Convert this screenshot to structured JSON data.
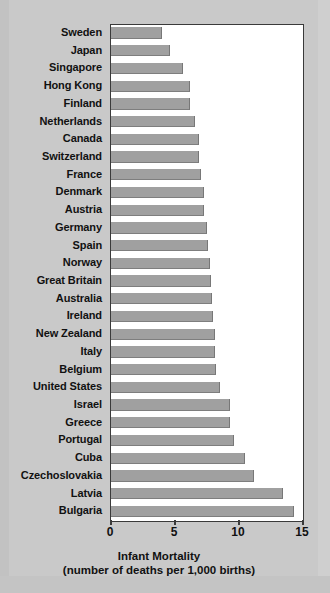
{
  "chart_data": {
    "type": "bar",
    "orientation": "horizontal",
    "title": "",
    "xlabel": "Infant Mortality",
    "xlabel_sub": "(number of deaths per 1,000 births)",
    "ylabel": "",
    "xlim": [
      0,
      15
    ],
    "xticks": [
      0,
      5,
      10,
      15
    ],
    "xtick_labels": [
      "0",
      "5",
      "10",
      "15"
    ],
    "grid": false,
    "legend": false,
    "bar_color": "#a0a0a0",
    "plot_background": "#ffffff",
    "page_background": "#c9c9c9",
    "categories": [
      "Sweden",
      "Japan",
      "Singapore",
      "Hong Kong",
      "Finland",
      "Netherlands",
      "Canada",
      "Switzerland",
      "France",
      "Denmark",
      "Austria",
      "Germany",
      "Spain",
      "Norway",
      "Great Britain",
      "Australia",
      "Ireland",
      "New Zealand",
      "Italy",
      "Belgium",
      "United States",
      "Israel",
      "Greece",
      "Portugal",
      "Cuba",
      "Czechoslovakia",
      "Latvia",
      "Bulgaria"
    ],
    "values": [
      4.0,
      4.6,
      5.6,
      6.2,
      6.2,
      6.6,
      6.9,
      6.9,
      7.0,
      7.3,
      7.3,
      7.5,
      7.6,
      7.7,
      7.8,
      7.9,
      8.0,
      8.1,
      8.1,
      8.2,
      8.5,
      9.3,
      9.3,
      9.6,
      10.5,
      11.2,
      13.4,
      14.3
    ]
  }
}
